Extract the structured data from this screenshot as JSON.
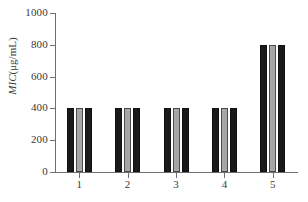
{
  "chart_data": {
    "type": "bar",
    "title": "",
    "subtitle": "",
    "xlabel": "",
    "ylabel": "MIC(μg/mL)",
    "ylabel_parts": {
      "italic": "MIC",
      "rest": "(μg/mL)"
    },
    "categories": [
      "1",
      "2",
      "3",
      "4",
      "5"
    ],
    "series": [
      {
        "name": "series-1",
        "color": "#1a1a1a",
        "values": [
          400,
          400,
          400,
          400,
          800
        ]
      },
      {
        "name": "series-2",
        "color": "#a6a6a6",
        "values": [
          400,
          400,
          400,
          400,
          800
        ]
      },
      {
        "name": "series-3",
        "color": "#1a1a1a",
        "values": [
          400,
          400,
          400,
          400,
          800
        ]
      }
    ],
    "ylim": [
      0,
      1000
    ],
    "yticks": [
      0,
      200,
      400,
      600,
      800,
      1000
    ],
    "ytick_labels": [
      "0",
      "200",
      "400",
      "600",
      "800",
      "1000"
    ],
    "xtick_labels": [
      "1",
      "2",
      "3",
      "4",
      "5"
    ],
    "grid": false,
    "legend": false,
    "legend_position": "none",
    "axis_color": "#6f6f6f",
    "text_color": "#3a3a3a",
    "background": "#ffffff"
  }
}
